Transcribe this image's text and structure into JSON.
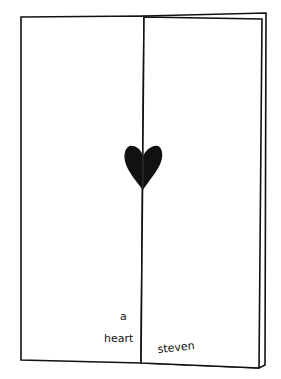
{
  "illustration": {
    "subject": "folded greeting card with heart",
    "texts": {
      "a": "a",
      "heart": "heart",
      "steven": "steven"
    },
    "colors": {
      "ink": "#111111",
      "paper": "#ffffff"
    }
  }
}
